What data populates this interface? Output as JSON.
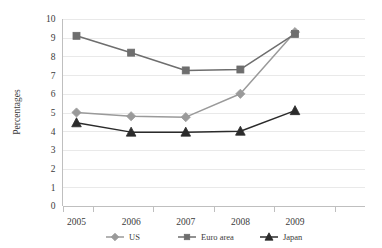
{
  "chart_data": {
    "type": "line",
    "title": "",
    "subtitle": "",
    "xlabel": "",
    "ylabel": "Percentages",
    "categories": [
      "2005",
      "2006",
      "2007",
      "2008",
      "2009"
    ],
    "x": [
      2005,
      2006,
      2007,
      2008,
      2009
    ],
    "ylim": [
      0,
      10
    ],
    "y_ticks": [
      "0",
      "1",
      "2",
      "3",
      "4",
      "5",
      "6",
      "7",
      "8",
      "9",
      "10"
    ],
    "y_tick_values": [
      0,
      1,
      2,
      3,
      4,
      5,
      6,
      7,
      8,
      9,
      10
    ],
    "grid": true,
    "legend_position": "bottom",
    "series": [
      {
        "name": "US",
        "values": [
          5.0,
          4.8,
          4.75,
          6.0,
          9.3
        ],
        "color": "#9a9a9a",
        "marker": "diamond"
      },
      {
        "name": "Euro area",
        "values": [
          9.1,
          8.2,
          7.25,
          7.3,
          9.2
        ],
        "color": "#6e6e6e",
        "marker": "square"
      },
      {
        "name": "Japan",
        "values": [
          4.45,
          3.95,
          3.95,
          4.0,
          5.1
        ],
        "color": "#2b2b2b",
        "marker": "triangle"
      }
    ]
  },
  "legend": {
    "items": [
      {
        "label": "US",
        "color": "#9a9a9a",
        "marker": "diamond"
      },
      {
        "label": "Euro area",
        "color": "#6e6e6e",
        "marker": "square"
      },
      {
        "label": "Japan",
        "color": "#2b2b2b",
        "marker": "triangle"
      }
    ]
  },
  "axes": {
    "y_title": "Percentages",
    "y_tick_labels": [
      "10",
      "9",
      "8",
      "7",
      "6",
      "5",
      "4",
      "3",
      "2",
      "1",
      "0"
    ],
    "x_tick_labels": [
      "2005",
      "2006",
      "2007",
      "2008",
      "2009"
    ]
  }
}
